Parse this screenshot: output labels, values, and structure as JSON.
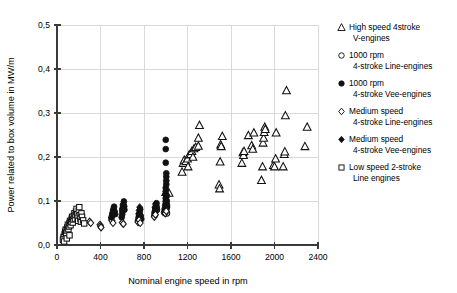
{
  "chart_data": {
    "type": "scatter",
    "title": "",
    "xlabel": "Nominal engine speed in rpm",
    "ylabel": "Power related to box volume in MW/m",
    "xlim": [
      0,
      2400
    ],
    "ylim": [
      0,
      0.5
    ],
    "xticks": [
      0,
      400,
      800,
      1200,
      1600,
      2000,
      2400
    ],
    "xtick_labels": [
      "0",
      "400",
      "800",
      "1200",
      "1600",
      "2000",
      "2400"
    ],
    "yticks": [
      0.0,
      0.1,
      0.2,
      0.3,
      0.4,
      0.5
    ],
    "ytick_labels": [
      "0,0",
      "0,1",
      "0,2",
      "0,3",
      "0,4",
      "0,5"
    ],
    "grid": true,
    "legend_position": "right",
    "decimal_separator": ",",
    "series": [
      {
        "name": "High speed 4stroke V-engines",
        "marker": "triangle-open",
        "legend_lines": [
          "High speed 4stroke",
          "V-engines"
        ],
        "points": [
          [
            1000,
            0.12
          ],
          [
            1030,
            0.118
          ],
          [
            1150,
            0.166
          ],
          [
            1160,
            0.186
          ],
          [
            1170,
            0.193
          ],
          [
            1185,
            0.19
          ],
          [
            1200,
            0.196
          ],
          [
            1205,
            0.178
          ],
          [
            1215,
            0.205
          ],
          [
            1230,
            0.206
          ],
          [
            1240,
            0.213
          ],
          [
            1250,
            0.2
          ],
          [
            1260,
            0.219
          ],
          [
            1275,
            0.222
          ],
          [
            1300,
            0.243
          ],
          [
            1300,
            0.225
          ],
          [
            1310,
            0.272
          ],
          [
            1490,
            0.137
          ],
          [
            1495,
            0.128
          ],
          [
            1500,
            0.189
          ],
          [
            1505,
            0.228
          ],
          [
            1510,
            0.224
          ],
          [
            1520,
            0.247
          ],
          [
            1700,
            0.186
          ],
          [
            1710,
            0.21
          ],
          [
            1715,
            0.204
          ],
          [
            1720,
            0.213
          ],
          [
            1760,
            0.249
          ],
          [
            1790,
            0.226
          ],
          [
            1800,
            0.218
          ],
          [
            1810,
            0.255
          ],
          [
            1880,
            0.147
          ],
          [
            1890,
            0.178
          ],
          [
            1895,
            0.232
          ],
          [
            1900,
            0.243
          ],
          [
            1905,
            0.256
          ],
          [
            1910,
            0.268
          ],
          [
            1915,
            0.263
          ],
          [
            1990,
            0.181
          ],
          [
            2000,
            0.178
          ],
          [
            2010,
            0.196
          ],
          [
            2015,
            0.255
          ],
          [
            2080,
            0.178
          ],
          [
            2090,
            0.206
          ],
          [
            2095,
            0.212
          ],
          [
            2100,
            0.294
          ],
          [
            2110,
            0.351
          ],
          [
            2280,
            0.224
          ],
          [
            2300,
            0.268
          ]
        ]
      },
      {
        "name": "1000 rpm 4-stroke Line-engines",
        "marker": "circle-open",
        "legend_lines": [
          "1000 rpm",
          "4-stroke Line-engines"
        ],
        "points": [
          [
            900,
            0.074
          ],
          [
            905,
            0.079
          ],
          [
            910,
            0.082
          ],
          [
            915,
            0.086
          ],
          [
            995,
            0.073
          ],
          [
            1000,
            0.076
          ],
          [
            1000,
            0.08
          ],
          [
            1005,
            0.084
          ],
          [
            1010,
            0.088
          ],
          [
            1010,
            0.072
          ]
        ]
      },
      {
        "name": "1000 rpm 4-stroke Vee-engines",
        "marker": "circle-filled",
        "legend_lines": [
          "1000 rpm",
          "4-stroke Vee-engines"
        ],
        "points": [
          [
            500,
            0.06
          ],
          [
            505,
            0.066
          ],
          [
            510,
            0.071
          ],
          [
            515,
            0.077
          ],
          [
            520,
            0.082
          ],
          [
            525,
            0.087
          ],
          [
            530,
            0.076
          ],
          [
            535,
            0.07
          ],
          [
            595,
            0.063
          ],
          [
            600,
            0.07
          ],
          [
            600,
            0.078
          ],
          [
            605,
            0.085
          ],
          [
            610,
            0.092
          ],
          [
            615,
            0.099
          ],
          [
            618,
            0.088
          ],
          [
            620,
            0.08
          ],
          [
            745,
            0.055
          ],
          [
            750,
            0.062
          ],
          [
            755,
            0.068
          ],
          [
            760,
            0.074
          ],
          [
            765,
            0.081
          ],
          [
            770,
            0.066
          ],
          [
            775,
            0.059
          ],
          [
            895,
            0.068
          ],
          [
            900,
            0.075
          ],
          [
            905,
            0.082
          ],
          [
            910,
            0.089
          ],
          [
            915,
            0.095
          ],
          [
            920,
            0.08
          ],
          [
            985,
            0.074
          ],
          [
            990,
            0.082
          ],
          [
            995,
            0.09
          ],
          [
            1000,
            0.098
          ],
          [
            1000,
            0.106
          ],
          [
            1000,
            0.114
          ],
          [
            1000,
            0.122
          ],
          [
            1000,
            0.13
          ],
          [
            1005,
            0.138
          ],
          [
            1005,
            0.146
          ],
          [
            1005,
            0.155
          ],
          [
            1005,
            0.163
          ],
          [
            1010,
            0.112
          ],
          [
            1010,
            0.1
          ],
          [
            1010,
            0.092
          ],
          [
            1010,
            0.085
          ],
          [
            1000,
            0.187
          ],
          [
            1000,
            0.218
          ],
          [
            1000,
            0.239
          ]
        ]
      },
      {
        "name": "Medium speed 4-stroke Line-engines",
        "marker": "diamond-open",
        "legend_lines": [
          "Medium speed",
          "4-stroke Line-engines"
        ],
        "points": [
          [
            300,
            0.053
          ],
          [
            310,
            0.05
          ],
          [
            395,
            0.046
          ],
          [
            400,
            0.043
          ],
          [
            405,
            0.04
          ],
          [
            505,
            0.055
          ],
          [
            515,
            0.05
          ],
          [
            600,
            0.051
          ],
          [
            610,
            0.048
          ],
          [
            745,
            0.052
          ],
          [
            755,
            0.057
          ],
          [
            765,
            0.05
          ],
          [
            895,
            0.064
          ],
          [
            905,
            0.069
          ],
          [
            995,
            0.072
          ],
          [
            1005,
            0.077
          ]
        ]
      },
      {
        "name": "Medium speed 4-stroke Vee-engines",
        "marker": "diamond-filled",
        "legend_lines": [
          "Medium speed",
          "4-stroke Vee-engines"
        ],
        "points": [
          [
            500,
            0.063
          ],
          [
            510,
            0.072
          ],
          [
            600,
            0.082
          ],
          [
            605,
            0.091
          ],
          [
            750,
            0.071
          ],
          [
            755,
            0.079
          ],
          [
            760,
            0.086
          ],
          [
            900,
            0.086
          ],
          [
            905,
            0.093
          ],
          [
            1000,
            0.093
          ],
          [
            1000,
            0.1
          ]
        ]
      },
      {
        "name": "Low speed 2-stroke Line engines",
        "marker": "square-open",
        "legend_lines": [
          "Low speed 2-stroke",
          "Line engines"
        ],
        "points": [
          [
            60,
            0.018
          ],
          [
            70,
            0.024
          ],
          [
            75,
            0.03
          ],
          [
            80,
            0.035
          ],
          [
            85,
            0.027
          ],
          [
            90,
            0.033
          ],
          [
            95,
            0.04
          ],
          [
            100,
            0.046
          ],
          [
            105,
            0.036
          ],
          [
            110,
            0.042
          ],
          [
            115,
            0.05
          ],
          [
            120,
            0.055
          ],
          [
            125,
            0.045
          ],
          [
            130,
            0.052
          ],
          [
            135,
            0.06
          ],
          [
            140,
            0.064
          ],
          [
            145,
            0.051
          ],
          [
            150,
            0.058
          ],
          [
            155,
            0.066
          ],
          [
            160,
            0.072
          ],
          [
            165,
            0.06
          ],
          [
            170,
            0.068
          ],
          [
            175,
            0.076
          ],
          [
            180,
            0.082
          ],
          [
            185,
            0.07
          ],
          [
            190,
            0.062
          ],
          [
            195,
            0.055
          ],
          [
            200,
            0.078
          ],
          [
            205,
            0.086
          ],
          [
            210,
            0.068
          ],
          [
            215,
            0.06
          ],
          [
            220,
            0.053
          ],
          [
            225,
            0.072
          ],
          [
            230,
            0.064
          ],
          [
            240,
            0.056
          ],
          [
            250,
            0.049
          ],
          [
            55,
            0.012
          ],
          [
            65,
            0.008
          ],
          [
            90,
            0.015
          ],
          [
            115,
            0.022
          ]
        ]
      }
    ]
  },
  "legend": {
    "entries": [
      {
        "marker": "triangle-open",
        "line1": "High speed 4stroke",
        "line2": "V-engines"
      },
      {
        "marker": "circle-open",
        "line1": "1000 rpm",
        "line2": "4-stroke Line-engines"
      },
      {
        "marker": "circle-filled",
        "line1": "1000 rpm",
        "line2": "4-stroke Vee-engines"
      },
      {
        "marker": "diamond-open",
        "line1": "Medium speed",
        "line2": "4-stroke Line-engines"
      },
      {
        "marker": "diamond-filled",
        "line1": "Medium speed",
        "line2": "4-stroke Vee-engines"
      },
      {
        "marker": "square-open",
        "line1": "Low speed 2-stroke",
        "line2": "Line engines"
      }
    ]
  },
  "colors": {
    "marker": "#111111",
    "grid": "#d9d9d9",
    "axis": "#3a3a3a",
    "background": "#ffffff"
  }
}
